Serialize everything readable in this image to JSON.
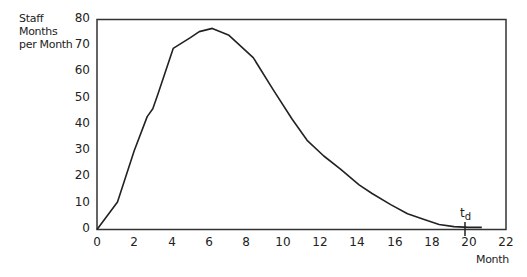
{
  "chart_data": {
    "type": "line",
    "title": "",
    "xlabel": "Month",
    "ylabel_lines": [
      "Staff",
      "Months",
      "per Month"
    ],
    "ylabel": "Staff Months per Month",
    "xlim": [
      0,
      22
    ],
    "ylim": [
      0,
      80
    ],
    "grid": false,
    "legend": null,
    "x_ticks": [
      0,
      2,
      4,
      6,
      8,
      10,
      12,
      14,
      16,
      18,
      20,
      22
    ],
    "y_ticks": [
      0,
      10,
      20,
      30,
      40,
      50,
      60,
      70,
      80
    ],
    "annotations": [
      {
        "text": "t",
        "subscript": "d",
        "x": 20,
        "y": 0,
        "marker": "tick"
      }
    ],
    "series": [
      {
        "name": "Staffing profile",
        "x": [
          0,
          1.1,
          2.0,
          2.7,
          3.0,
          3.3,
          4.1,
          5.0,
          5.5,
          6.2,
          7.1,
          8.4,
          9.5,
          10.5,
          11.3,
          12.2,
          13.1,
          14.1,
          14.8,
          15.8,
          16.7,
          17.6,
          18.4,
          19.2,
          20.0,
          20.7
        ],
        "y": [
          0,
          10.5,
          30,
          43,
          46,
          52,
          69,
          73,
          75.4,
          76.6,
          74,
          65.5,
          53,
          42,
          34,
          28,
          23,
          17,
          13.7,
          9.5,
          6,
          3.8,
          1.9,
          1.1,
          0.8,
          0.8
        ]
      }
    ]
  },
  "labels": {
    "y_title": [
      "Staff",
      "Months",
      "per Month"
    ],
    "x_title": "Month",
    "annotation_main": "t",
    "annotation_sub": "d",
    "x_ticks": [
      "0",
      "2",
      "4",
      "6",
      "8",
      "10",
      "12",
      "14",
      "16",
      "18",
      "20",
      "22"
    ],
    "y_ticks": [
      "80",
      "70",
      "60",
      "50",
      "40",
      "30",
      "20",
      "10",
      "0"
    ]
  }
}
